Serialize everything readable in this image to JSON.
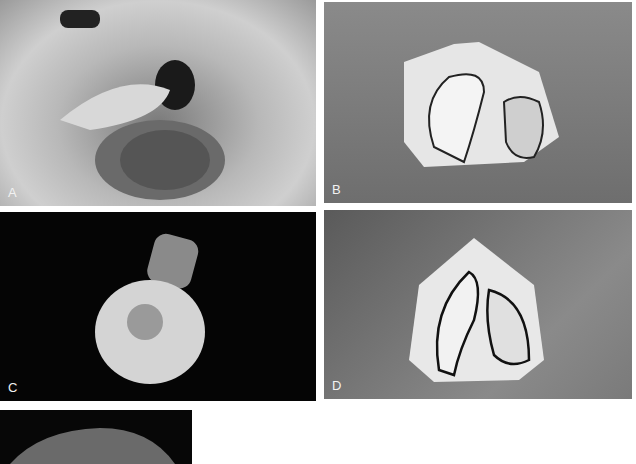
{
  "figure": {
    "panels": [
      {
        "id": "A",
        "label": "A",
        "description": "Infant with cleft lip and palate, open mouth view"
      },
      {
        "id": "B",
        "label": "B",
        "description": "Dental cast with outlined palatal segments, occlusal view"
      },
      {
        "id": "C",
        "label": "C",
        "description": "Impression tray with handle on dark background"
      },
      {
        "id": "D",
        "label": "D",
        "description": "Dental cast with outlined segments, later stage"
      },
      {
        "id": "E",
        "label": "",
        "description": "Partially visible photograph of infant head"
      }
    ]
  }
}
